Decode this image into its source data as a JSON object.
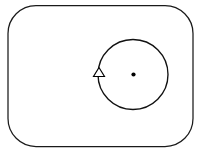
{
  "canvas": {
    "width": 209,
    "height": 155,
    "background_color": "#ffffff",
    "title": "Circular motion diagram"
  },
  "frame": {
    "name": "rounded-rectangle-border",
    "stroke_color": "#1a1a1a",
    "stroke_width": 1.25,
    "fill": "none",
    "x": 8,
    "y": 5.5,
    "width": 185,
    "height": 141,
    "corner_radius": 28
  },
  "chart_data": {
    "type": "diagram",
    "title": "Circular motion diagram",
    "elements": [
      {
        "id": "frame",
        "shape": "rounded-rectangle",
        "label": "outer border",
        "x": 8,
        "y": 5.5,
        "width": 185,
        "height": 141,
        "corner_radius": 28,
        "stroke": "#1a1a1a",
        "fill": "none"
      },
      {
        "id": "orbit",
        "shape": "circle",
        "label": "circular path",
        "cx": 133,
        "cy": 74.5,
        "r": 35,
        "stroke": "#111111",
        "fill": "none"
      },
      {
        "id": "center",
        "shape": "dot",
        "label": "center point",
        "cx": 133.5,
        "cy": 74.5,
        "r": 2.1,
        "fill": "#000000"
      },
      {
        "id": "direction",
        "shape": "triangle",
        "label": "direction arrowhead",
        "cx": 99,
        "cy": 72,
        "width": 11,
        "height": 9,
        "points_toward": "up",
        "fill": "#ffffff",
        "stroke": "#000000"
      }
    ],
    "xlim": [
      0,
      209
    ],
    "ylim": [
      0,
      155
    ],
    "grid": false,
    "legend": null
  },
  "colors": {
    "ink": "#111111",
    "frame_ink": "#1a1a1a",
    "paper": "#ffffff"
  },
  "labels": {
    "figure_caption": "Circular motion diagram"
  }
}
